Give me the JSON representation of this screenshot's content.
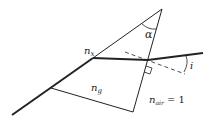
{
  "diagram": {
    "labels": {
      "alpha": "α",
      "n_x": "n",
      "n_x_sub": "x",
      "n_g": "n",
      "n_g_sub": "g",
      "n_air": "n",
      "n_air_sub": "air",
      "n_air_value": " = 1",
      "angle_i": "i"
    },
    "colors": {
      "line": "#222222",
      "background": "#ffffff"
    }
  }
}
